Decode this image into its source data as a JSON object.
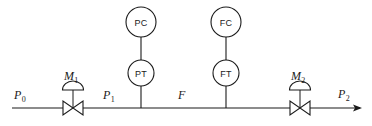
{
  "diagram": {
    "type": "process-instrumentation-diagram",
    "line_color": "#1a1a1a",
    "background_color": "#ffffff",
    "pipe": {
      "name": "main-process-pipe",
      "flow_direction": "left-to-right",
      "inlet_label": "P",
      "inlet_subscript": "0",
      "intermediate_label": "P",
      "intermediate_subscript": "1",
      "flow_label": "F",
      "outlet_label": "P",
      "outlet_subscript": "2"
    },
    "valves": [
      {
        "name": "control-valve-m1",
        "label": "M",
        "subscript": "1",
        "type": "diaphragm-actuated-globe-valve"
      },
      {
        "name": "control-valve-m2",
        "label": "M",
        "subscript": "2",
        "type": "diaphragm-actuated-globe-valve"
      }
    ],
    "instruments": [
      {
        "name": "pressure-controller",
        "tag": "PC",
        "description": "Pressure Controller"
      },
      {
        "name": "pressure-transmitter",
        "tag": "PT",
        "description": "Pressure Transmitter"
      },
      {
        "name": "flow-controller",
        "tag": "FC",
        "description": "Flow Controller"
      },
      {
        "name": "flow-transmitter",
        "tag": "FT",
        "description": "Flow Transmitter"
      }
    ]
  }
}
